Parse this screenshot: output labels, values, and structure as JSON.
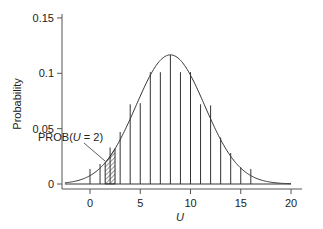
{
  "chart_data": {
    "type": "bar",
    "subtype": "stick-plot-with-normal-curve-overlay",
    "title": "",
    "xlabel": "U",
    "ylabel": "Probability",
    "xlim": [
      -3,
      21
    ],
    "ylim": [
      0,
      0.15
    ],
    "x_ticks": [
      0,
      5,
      10,
      15,
      20
    ],
    "x_tick_labels": [
      "0",
      "5",
      "10",
      "15",
      "20"
    ],
    "y_ticks": [
      0,
      0.05,
      0.1,
      0.15
    ],
    "y_tick_labels": [
      "0",
      "0.05",
      "0.1",
      "0.15"
    ],
    "grid": false,
    "legend": null,
    "series": [
      {
        "name": "Discrete probability (sticks)",
        "type": "stick",
        "x": [
          0,
          1,
          2,
          3,
          4,
          5,
          6,
          7,
          8,
          9,
          10,
          11,
          12,
          13,
          14,
          15,
          16
        ],
        "values": [
          0.0135,
          0.018,
          0.033,
          0.047,
          0.072,
          0.073,
          0.101,
          0.101,
          0.1165,
          0.101,
          0.101,
          0.072,
          0.071,
          0.042,
          0.028,
          0.015,
          0.0135
        ]
      },
      {
        "name": "Normal approximation",
        "type": "line",
        "distribution": "normal",
        "mean": 8,
        "sd": 3.42,
        "x_range": [
          -2.5,
          20
        ]
      }
    ],
    "highlight": {
      "type": "hatched-area",
      "x_from": 1.5,
      "x_to": 2.5,
      "under": "Normal approximation",
      "label": "PROB(U=2)"
    },
    "annotations": [
      {
        "text_prefix": "PROB(",
        "text_var": "U",
        "text_suffix": "=2)",
        "points_to": "hatched-area"
      }
    ]
  },
  "labels": {
    "ylabel": "Probability",
    "xlabel": "U",
    "annotation_prefix": "PROB(",
    "annotation_var": "U",
    "annotation_suffix": " = 2)"
  }
}
